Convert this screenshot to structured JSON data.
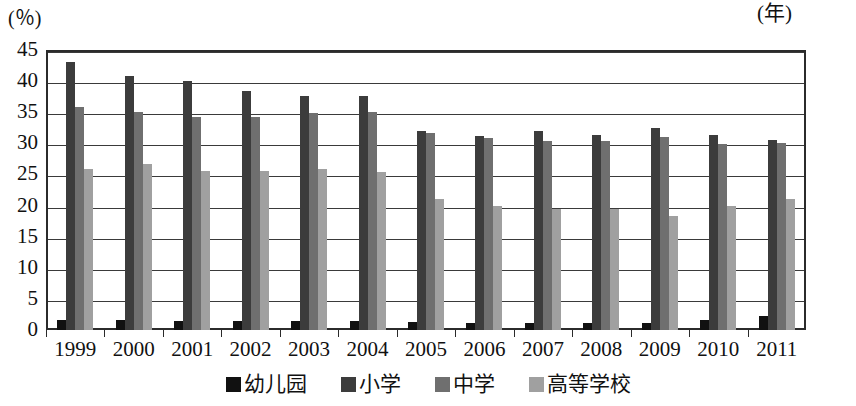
{
  "chart_data": {
    "type": "bar",
    "title": "",
    "subtitle": "",
    "xlabel": "(年)",
    "ylabel": "(%)",
    "ylim": [
      0,
      45
    ],
    "yticks": [
      0,
      5,
      10,
      15,
      20,
      25,
      30,
      35,
      40,
      45
    ],
    "grid": true,
    "legend_position": "bottom",
    "categories": [
      "1999",
      "2000",
      "2001",
      "2002",
      "2003",
      "2004",
      "2005",
      "2006",
      "2007",
      "2008",
      "2009",
      "2010",
      "2011"
    ],
    "series": [
      {
        "name": "幼儿园",
        "color": "#111111",
        "values": [
          1.6,
          1.6,
          1.5,
          1.4,
          1.4,
          1.4,
          1.3,
          1.2,
          1.2,
          1.1,
          1.2,
          1.6,
          2.3
        ]
      },
      {
        "name": "小学",
        "color": "#3c3c3c",
        "values": [
          43.0,
          40.8,
          40.0,
          38.4,
          37.6,
          37.6,
          32.0,
          31.2,
          32.0,
          31.4,
          32.4,
          31.4,
          30.6
        ]
      },
      {
        "name": "中学",
        "color": "#6f6f6f",
        "values": [
          35.8,
          35.0,
          34.3,
          34.2,
          34.9,
          35.0,
          31.7,
          30.8,
          30.4,
          30.4,
          31.0,
          29.9,
          30.0
        ]
      },
      {
        "name": "高等学校",
        "color": "#a0a0a0",
        "values": [
          25.9,
          26.7,
          25.5,
          25.6,
          25.9,
          25.4,
          21.0,
          20.0,
          19.4,
          19.4,
          18.4,
          19.9,
          21.0
        ]
      }
    ]
  },
  "axis": {
    "y_unit_label": "(％)",
    "x_unit_label": "(年)"
  }
}
